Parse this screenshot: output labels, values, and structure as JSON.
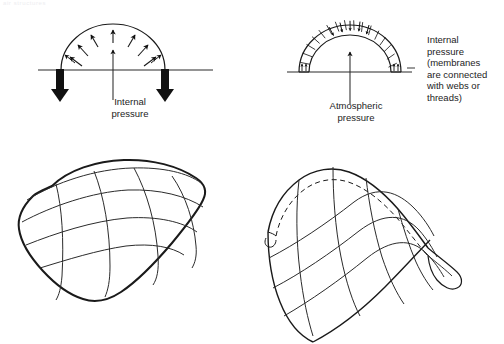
{
  "figure": {
    "width": 504,
    "height": 344,
    "background": "#ffffff",
    "ink": "#1a1a1a",
    "header_fragment": "air structures"
  },
  "captions": {
    "internal_pressure_left": "Internal\npressure",
    "atmospheric_pressure": "Atmospheric\npressure",
    "internal_pressure_right": "Internal\npressure\n(membranes\nare connected\nwith webs or\nthreads)"
  },
  "panels": [
    {
      "id": "air-supported-arch",
      "name": "single-membrane-arch",
      "caption_key": "internal_pressure_left",
      "has_ground_line": true,
      "has_anchor_arrows": true,
      "anchor_arrow_count": 2,
      "radial_arrow_count": 9,
      "membrane": "single",
      "pressure_direction": "outward"
    },
    {
      "id": "air-inflated-arch",
      "name": "double-membrane-arch",
      "caption_key": "atmospheric_pressure",
      "has_ground_line": true,
      "has_anchor_arrows": false,
      "rib_count": 22,
      "membrane": "double",
      "pressure_direction": "inward"
    },
    {
      "id": "air-supported-dome",
      "name": "cable-restrained-pillow-dome",
      "grid_longitudinal": 4,
      "grid_transverse": 4,
      "membrane": "single"
    },
    {
      "id": "air-inflated-vault",
      "name": "double-wall-barrel-vault",
      "grid_longitudinal": 4,
      "grid_transverse": 4,
      "membrane": "double",
      "has_dashed_inner_edge": true
    }
  ],
  "colors": {
    "line": "#1a1a1a",
    "thin_line": "#2b2b2b",
    "arrow_fill": "#111111",
    "text": "#1c1c1c",
    "faint_header": "#ededf0"
  }
}
